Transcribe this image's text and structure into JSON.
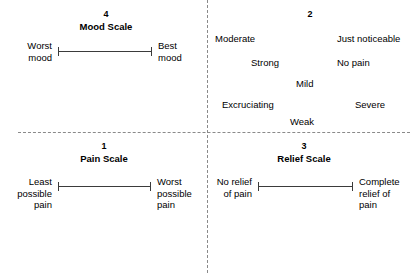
{
  "figure": {
    "quadrants": [
      {
        "id": "mood-scale",
        "number": "4",
        "title": "Mood Scale",
        "left_anchor": "Worst\nmood",
        "right_anchor": "Best\nmood"
      },
      {
        "id": "descriptor-words",
        "number": "2",
        "title": "",
        "words": [
          "Moderate",
          "Just noticeable",
          "Strong",
          "No pain",
          "Mild",
          "Excruciating",
          "Severe",
          "Weak"
        ]
      },
      {
        "id": "pain-scale",
        "number": "1",
        "title": "Pain Scale",
        "left_anchor": "Least\npossible\npain",
        "right_anchor": "Worst\npossible\npain"
      },
      {
        "id": "relief-scale",
        "number": "3",
        "title": "Relief Scale",
        "left_anchor": "No relief\nof pain",
        "right_anchor": "Complete\nrelief of\npain"
      }
    ],
    "colors": {
      "background": "#ffffff",
      "text": "#000000",
      "scale_line": "#3b3b3b",
      "divider": "#8a8a8a"
    }
  }
}
